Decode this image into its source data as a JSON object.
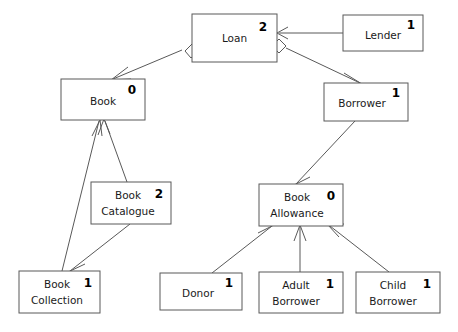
{
  "diagram": {
    "type": "uml-class-diagram",
    "background_color": "#ffffff",
    "box_stroke_color": "#595959",
    "text_color": "#1a1a1a",
    "nodes": [
      {
        "id": "loan",
        "name": "Loan",
        "line1": "Loan",
        "line2": "",
        "multiplicity": "2",
        "x": 192,
        "y": 14,
        "w": 85,
        "h": 48
      },
      {
        "id": "lender",
        "name": "Lender",
        "line1": "Lender",
        "line2": "",
        "multiplicity": "1",
        "x": 343,
        "y": 15,
        "w": 80,
        "h": 36
      },
      {
        "id": "book",
        "name": "Book",
        "line1": "Book",
        "line2": "",
        "multiplicity": "0",
        "x": 61,
        "y": 79,
        "w": 84,
        "h": 41
      },
      {
        "id": "borrower",
        "name": "Borrower",
        "line1": "Borrower",
        "line2": "",
        "multiplicity": "1",
        "x": 324,
        "y": 83,
        "w": 84,
        "h": 38
      },
      {
        "id": "book-catalogue",
        "name": "Book Catalogue",
        "line1": "Book",
        "line2": "Catalogue",
        "multiplicity": "2",
        "x": 91,
        "y": 182,
        "w": 80,
        "h": 42
      },
      {
        "id": "book-allowance",
        "name": "Book Allowance",
        "line1": "Book",
        "line2": "Allowance",
        "multiplicity": "0",
        "x": 259,
        "y": 184,
        "w": 84,
        "h": 42
      },
      {
        "id": "book-collection",
        "name": "Book Collection",
        "line1": "Book",
        "line2": "Collection",
        "multiplicity": "1",
        "x": 19,
        "y": 271,
        "w": 81,
        "h": 42
      },
      {
        "id": "donor",
        "name": "Donor",
        "line1": "Donor",
        "line2": "",
        "multiplicity": "1",
        "x": 160,
        "y": 273,
        "w": 82,
        "h": 37
      },
      {
        "id": "adult-borrower",
        "name": "Adult Borrower",
        "line1": "Adult",
        "line2": "Borrower",
        "multiplicity": "1",
        "x": 259,
        "y": 272,
        "w": 84,
        "h": 41
      },
      {
        "id": "child-borrower",
        "name": "Child Borrower",
        "line1": "Child",
        "line2": "Borrower",
        "multiplicity": "1",
        "x": 356,
        "y": 272,
        "w": 84,
        "h": 41
      }
    ],
    "edges": [
      {
        "id": "loan-book",
        "from": "loan",
        "to": "book",
        "kind": "aggregation-arrow",
        "source_decoration": "hollow-diamond",
        "target_decoration": "open-arrow"
      },
      {
        "id": "lender-loan",
        "from": "lender",
        "to": "loan",
        "kind": "association",
        "source_decoration": "none",
        "target_decoration": "open-arrow"
      },
      {
        "id": "loan-borrower",
        "from": "loan",
        "to": "borrower",
        "kind": "aggregation-arrow",
        "source_decoration": "hollow-diamond",
        "target_decoration": "open-arrow"
      },
      {
        "id": "book-catalogue-book",
        "from": "book-catalogue",
        "to": "book",
        "kind": "association",
        "source_decoration": "none",
        "target_decoration": "open-arrow"
      },
      {
        "id": "book-collection-book",
        "from": "book-collection",
        "to": "book",
        "kind": "association",
        "source_decoration": "none",
        "target_decoration": "open-arrow"
      },
      {
        "id": "book-catalogue-book-collection",
        "from": "book-catalogue",
        "to": "book-collection",
        "kind": "association",
        "source_decoration": "none",
        "target_decoration": "open-arrow"
      },
      {
        "id": "borrower-book-allowance",
        "from": "borrower",
        "to": "book-allowance",
        "kind": "association",
        "source_decoration": "none",
        "target_decoration": "open-arrow"
      },
      {
        "id": "donor-book-allowance",
        "from": "donor",
        "to": "book-allowance",
        "kind": "association",
        "source_decoration": "none",
        "target_decoration": "open-arrow"
      },
      {
        "id": "adult-borrower-book-allowance",
        "from": "adult-borrower",
        "to": "book-allowance",
        "kind": "association",
        "source_decoration": "none",
        "target_decoration": "open-arrow"
      },
      {
        "id": "child-borrower-book-allowance",
        "from": "child-borrower",
        "to": "book-allowance",
        "kind": "association",
        "source_decoration": "none",
        "target_decoration": "open-arrow"
      }
    ]
  }
}
